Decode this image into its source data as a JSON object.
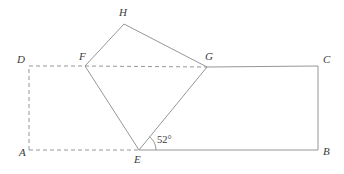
{
  "figure": {
    "width": 344,
    "height": 174,
    "background": "#ffffff",
    "stroke_color": "#8a8a8a",
    "label_color": "#3a3a3a",
    "stroke_width": 0.9,
    "dash_pattern": "4 3"
  },
  "points": {
    "A": {
      "label": "A",
      "x": 29,
      "y": 150,
      "label_x": 19,
      "label_y": 156
    },
    "B": {
      "label": "B",
      "x": 318,
      "y": 150,
      "label_x": 323,
      "label_y": 155
    },
    "C": {
      "label": "C",
      "x": 318,
      "y": 66,
      "label_x": 323,
      "label_y": 63
    },
    "D": {
      "label": "D",
      "x": 29,
      "y": 66,
      "label_x": 17,
      "label_y": 63
    },
    "E": {
      "label": "E",
      "x": 139,
      "y": 150,
      "label_x": 134,
      "label_y": 163
    },
    "F": {
      "label": "F",
      "x": 85,
      "y": 66,
      "label_x": 79,
      "label_y": 60
    },
    "G": {
      "label": "G",
      "x": 207,
      "y": 67,
      "label_x": 205,
      "label_y": 60
    },
    "H": {
      "label": "H",
      "x": 124,
      "y": 24,
      "label_x": 119,
      "label_y": 16
    }
  },
  "segments": [
    {
      "name": "segment-A-D",
      "from": "A",
      "to": "D",
      "style": "dashed"
    },
    {
      "name": "segment-D-F",
      "from": "D",
      "to": "F",
      "style": "dashed"
    },
    {
      "name": "segment-F-G",
      "from": "F",
      "to": "G",
      "style": "dashed"
    },
    {
      "name": "segment-A-E",
      "from": "A",
      "to": "E",
      "style": "dashed"
    },
    {
      "name": "segment-G-C",
      "from": "G",
      "to": "C",
      "style": "solid"
    },
    {
      "name": "segment-C-B",
      "from": "C",
      "to": "B",
      "style": "solid"
    },
    {
      "name": "segment-E-B",
      "from": "E",
      "to": "B",
      "style": "solid"
    },
    {
      "name": "segment-F-H",
      "from": "F",
      "to": "H",
      "style": "solid"
    },
    {
      "name": "segment-H-G",
      "from": "H",
      "to": "G",
      "style": "solid"
    },
    {
      "name": "segment-F-E",
      "from": "F",
      "to": "E",
      "style": "solid"
    },
    {
      "name": "segment-E-G",
      "from": "E",
      "to": "G",
      "style": "solid"
    }
  ],
  "angle": {
    "name": "angle-GEB",
    "vertex": "E",
    "value": "52°",
    "label_x": 157,
    "label_y": 143,
    "arc_radius": 17,
    "arc_path": "M 156 150 A 17 17 0 0 0 149.5 136.8"
  },
  "shapes": {
    "rectangle": {
      "name": "rectangle-ABCD",
      "vertices": [
        "A",
        "B",
        "C",
        "D"
      ]
    },
    "square": {
      "name": "square-EFHG",
      "vertices": [
        "E",
        "F",
        "H",
        "G"
      ]
    }
  }
}
